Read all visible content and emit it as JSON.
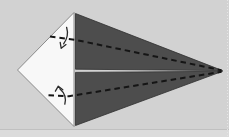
{
  "diagram": {
    "colors": {
      "page_background": "#d2d2d2",
      "paper_white": "#f8f8f8",
      "flap_dark": "#4d4d4d",
      "flap_outline": "#2e2e2e",
      "panel_outline": "#808080",
      "fold_line": "#151515",
      "arrow": "#2b2b2b",
      "page_crease": "#c0c0c0",
      "page_bottom_strip": "#dbdbdb",
      "page_edge_dots": "#e5e5e5"
    },
    "shapes": {
      "white_panel": {
        "points": "74,12.5 17.5,70 74,126.5"
      },
      "upper_flap": {
        "points": "75.5,13.5 222.5,70.6 75.5,69.2"
      },
      "lower_flap": {
        "points": "75.5,72.4 222.5,71.3 75.5,125.5"
      }
    },
    "fold_lines": {
      "upper": {
        "d": "M50,36.5 L76,40 L221.5,70.2"
      },
      "lower": {
        "d": "M48.5,95.3 L69,96.2 L221.5,71.8"
      }
    },
    "arrows": {
      "upper_stem": {
        "d": "M66.6,27.3 C68.3,33 67.6,38.5 63.6,43.8"
      },
      "upper_head": {
        "d": "M66,44.6 L61.2,48.3 L60.2,42.4"
      },
      "lower_stem": {
        "d": "M64.8,104.2 C66.4,98.5 64.6,93 59.8,88.8"
      },
      "lower_head": {
        "d": "M55.4,91.2 L58.3,86.2 L62.8,89.8"
      }
    },
    "page_artifacts": {
      "bottom_crease": {
        "d": "M0,129.5 L229,129.5"
      },
      "bottom_strip": {
        "d": "M0,130 L229,130 L229,137 L0,137 Z"
      },
      "right_edge": {
        "d": "M227.5,0 L227.5,137"
      }
    }
  }
}
